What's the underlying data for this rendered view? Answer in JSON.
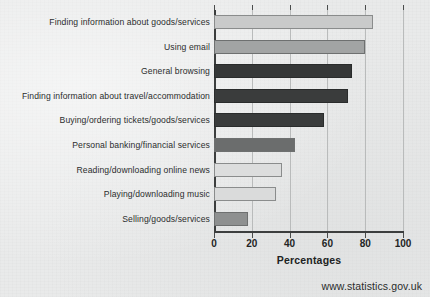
{
  "chart_data": {
    "type": "bar",
    "orientation": "horizontal",
    "title": "",
    "xlabel": "Percentages",
    "ylabel": "",
    "xlim": [
      0,
      100
    ],
    "x_ticks": [
      0,
      20,
      40,
      60,
      80,
      100
    ],
    "x_tick_labels": [
      "0",
      "20",
      "40",
      "60",
      "80",
      "100"
    ],
    "grid": true,
    "grid_axis": "x",
    "legend": false,
    "categories": [
      "Finding information about goods/services",
      "Using email",
      "General browsing",
      "Finding information about travel/accommodation",
      "Buying/ordering tickets/goods/services",
      "Personal banking/financial services",
      "Reading/downloading online news",
      "Playing/downloading music",
      "Selling/goods/services"
    ],
    "values": [
      84,
      80,
      73,
      71,
      58,
      43,
      36,
      33,
      18
    ],
    "bar_colors": [
      "#c9caca",
      "#a2a4a4",
      "#363838",
      "#3a3c3c",
      "#3a3c3c",
      "#6b6d6d",
      "#dcdddd",
      "#dadbdb",
      "#8e9090"
    ],
    "bar_shades": [
      "light",
      "mid",
      "dark",
      "dark",
      "dark",
      "middark",
      "light",
      "light",
      "mid"
    ]
  },
  "footer": {
    "url": "www.statistics.gov.uk"
  },
  "colors": {
    "background": "#e9eaea",
    "axis": "#3c3e3e",
    "gridline": "#b9bbbb",
    "text": "#2b2d2d"
  }
}
